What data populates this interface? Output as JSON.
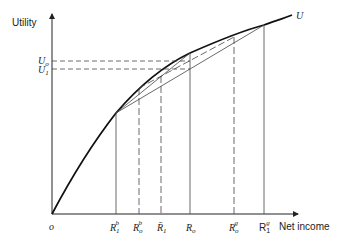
{
  "axes": {
    "y_label": "Utility",
    "x_label": "Net income",
    "origin_label": "o",
    "curve_label": "U"
  },
  "utility_levels": [
    {
      "main": "U",
      "sub": "o"
    },
    {
      "main": "U",
      "sub": "1"
    }
  ],
  "income_points": [
    {
      "main": "R",
      "sub": "1",
      "sup": "b"
    },
    {
      "main": "R",
      "sub": "o",
      "sup": "b"
    },
    {
      "main": "R̄",
      "sub": "1",
      "sup": ""
    },
    {
      "main": "R",
      "sub": "o",
      "sup": ""
    },
    {
      "main": "R",
      "sub": "o",
      "sup": "g"
    },
    {
      "main": "R",
      "sub": "1",
      "sup": "g"
    }
  ]
}
